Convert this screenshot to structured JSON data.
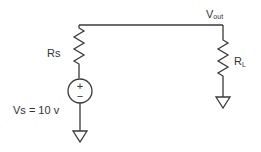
{
  "diagram": {
    "type": "circuit-schematic",
    "colors": {
      "wire": "#3a3a3a",
      "text": "#333333",
      "background": "#ffffff"
    },
    "nodes": {
      "vout": {
        "label_main": "V",
        "label_sub": "out"
      }
    },
    "components": {
      "source_resistor": {
        "label": "Rs"
      },
      "voltage_source": {
        "label": "Vs = 10 v",
        "plus": "+",
        "minus": "−"
      },
      "load_resistor": {
        "label_main": "R",
        "label_sub": "L"
      }
    }
  }
}
